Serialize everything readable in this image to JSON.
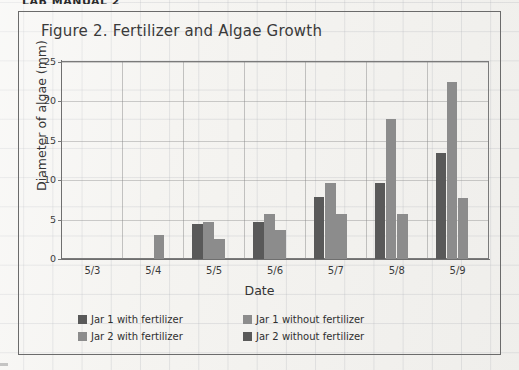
{
  "document": {
    "top_header_text": "LAB MANUAL 2"
  },
  "figure": {
    "title": "Figure 2. Fertilizer and Algae Growth"
  },
  "colors": {
    "series_dark": "#595959",
    "series_light": "#8c8c8c",
    "axis": "#6f6f6f",
    "frame": "#6b6b6b",
    "paper": "#f3f2ef",
    "grid": "#9aa0aa",
    "text": "#333333"
  },
  "chart_data": {
    "type": "bar",
    "title": "Figure 2. Fertilizer and Algae Growth",
    "xlabel": "Date",
    "ylabel": "Diameter of algae (mm)",
    "categories": [
      "5/3",
      "5/4",
      "5/5",
      "5/6",
      "5/7",
      "5/8",
      "5/9"
    ],
    "ylim": [
      0,
      25
    ],
    "yticks": [
      0,
      5,
      10,
      15,
      20,
      25
    ],
    "grid": true,
    "legend_position": "below-plot",
    "series": [
      {
        "name": "Jar 1 with fertilizer",
        "color": "#595959",
        "values": [
          0,
          0,
          4.4,
          4.7,
          7.9,
          9.7,
          13.5
        ]
      },
      {
        "name": "Jar 1 without fertilizer",
        "color": "#8c8c8c",
        "values": [
          0,
          0,
          4.7,
          5.7,
          9.6,
          17.8,
          22.5
        ]
      },
      {
        "name": "Jar 2 with fertilizer",
        "color": "#8c8c8c",
        "values": [
          0,
          3.0,
          2.5,
          3.7,
          5.7,
          5.7,
          7.8
        ]
      },
      {
        "name": "Jar 2 without fertilizer",
        "color": "#595959",
        "values": [
          0,
          0,
          0,
          0,
          0,
          0,
          0
        ]
      }
    ]
  },
  "legend": {
    "rows": [
      [
        {
          "label": "Jar 1 with fertilizer",
          "color": "#595959"
        },
        {
          "label": "Jar 1 without fertilizer",
          "color": "#8c8c8c"
        }
      ],
      [
        {
          "label": "Jar 2 with fertilizer",
          "color": "#8c8c8c"
        },
        {
          "label": "Jar 2 without fertilizer",
          "color": "#595959"
        }
      ]
    ]
  }
}
